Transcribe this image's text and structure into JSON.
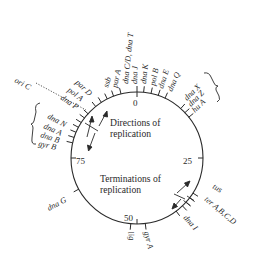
{
  "figure": {
    "type": "circular chromosome map",
    "circle": {
      "cx": 137,
      "cy": 158,
      "r": 66,
      "color": "#2a2a2a"
    },
    "scale_marks": [
      {
        "label": "0",
        "position": 0
      },
      {
        "label": "25",
        "position": 25
      },
      {
        "label": "50",
        "position": 50
      },
      {
        "label": "75",
        "position": 75
      }
    ],
    "captions": {
      "directions_line1": "Directions of",
      "directions_line2": "replication",
      "terminations_line1": "Terminations of",
      "terminations_line2": "replication"
    },
    "origin_label": "ori C",
    "genes": [
      {
        "id": "dnaJ",
        "label": "dna J",
        "position": 0.0
      },
      {
        "id": "dnaK",
        "label": "dna K",
        "position": 1.6
      },
      {
        "id": "polB",
        "label": "pol B",
        "position": 3.4
      },
      {
        "id": "dnaE",
        "label": "dna E",
        "position": 5.2
      },
      {
        "id": "dnaQ",
        "label": "dna Q",
        "position": 7.0
      },
      {
        "id": "dnaX",
        "label": "dna X",
        "position": 11.5
      },
      {
        "id": "dnaZ",
        "label": "dna Z",
        "position": 13.0
      },
      {
        "id": "hupA",
        "label": "hu A",
        "position": 14.5
      },
      {
        "id": "tus",
        "label": "tus",
        "position": 31.0
      },
      {
        "id": "terABCD",
        "label": "ter A,B,C,D",
        "position": 34.0
      },
      {
        "id": "dnaI",
        "label": "dna I",
        "position": 38.0
      },
      {
        "id": "gyrA",
        "label": "gyr A",
        "position": 48.0
      },
      {
        "id": "lig",
        "label": "lig",
        "position": 51.5
      },
      {
        "id": "dnaG",
        "label": "dna G",
        "position": 66.5
      },
      {
        "id": "gyrB",
        "label": "gyr B",
        "position": 81.5
      },
      {
        "id": "dnaB",
        "label": "dna B",
        "position": 83.0
      },
      {
        "id": "dnaA",
        "label": "dna A",
        "position": 84.5
      },
      {
        "id": "dnaN",
        "label": "dna N",
        "position": 86.0
      },
      {
        "id": "dnaP",
        "label": "dna P",
        "position": 87.5
      },
      {
        "id": "polA",
        "label": "pol A",
        "position": 89.0
      },
      {
        "id": "parD",
        "label": "par D",
        "position": 90.5
      },
      {
        "id": "ssb",
        "label": "ssb",
        "position": 93.0
      },
      {
        "id": "parA",
        "label": "par A",
        "position": 94.5
      },
      {
        "id": "dnaT",
        "label": "dna T",
        "position": 96.0
      },
      {
        "id": "dnaCD",
        "label": "dna C/D, dna T",
        "position": 97.5
      }
    ]
  }
}
